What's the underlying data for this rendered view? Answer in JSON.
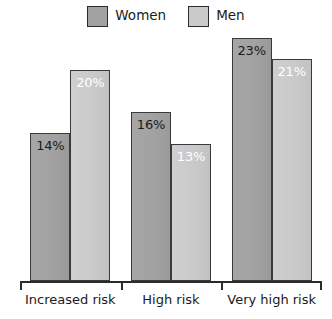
{
  "chart_data": {
    "type": "bar",
    "title": "",
    "xlabel": "",
    "ylabel": "",
    "ylim": [
      0,
      25
    ],
    "grid": false,
    "legend_position": "top-center",
    "categories": [
      "Increased risk",
      "High risk",
      "Very high risk"
    ],
    "series": [
      {
        "name": "Women",
        "color": "#a2a2a2",
        "label_color": "#1a1a1a",
        "values": [
          14,
          16,
          23
        ],
        "labels": [
          "14%",
          "16%",
          "23%"
        ]
      },
      {
        "name": "Men",
        "color": "#cacaca",
        "label_color": "#ffffff",
        "values": [
          20,
          13,
          21
        ],
        "labels": [
          "20%",
          "13%",
          "21%"
        ]
      }
    ]
  },
  "legend": {
    "entries": [
      {
        "label": "Women",
        "swatch_color": "#a2a2a2"
      },
      {
        "label": "Men",
        "swatch_color": "#cacaca"
      }
    ]
  },
  "axis": {
    "line_color": "#2b2b2b",
    "tick_count": 4
  }
}
